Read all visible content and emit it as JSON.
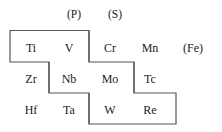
{
  "figure": {
    "kind": "periodic-table-fragment-diagram",
    "line_color": "#555555",
    "background_color": "#ffffff",
    "text_color": "#1a1a1a"
  },
  "group_headers": [
    {
      "label": "(P)",
      "x": 62,
      "y": 8,
      "width": 24
    },
    {
      "label": "(S)",
      "x": 103,
      "y": 8,
      "width": 24
    }
  ],
  "rows": [
    {
      "row_name": "row-1",
      "cells": [
        {
          "label": "Ti",
          "x": 14,
          "y": 41
        },
        {
          "label": "V",
          "x": 52,
          "y": 41
        },
        {
          "label": "Cr",
          "x": 93,
          "y": 41
        },
        {
          "label": "Mn",
          "x": 133,
          "y": 41
        },
        {
          "label": "(Fe)",
          "x": 176,
          "y": 41
        }
      ]
    },
    {
      "row_name": "row-2",
      "cells": [
        {
          "label": "Zr",
          "x": 14,
          "y": 72
        },
        {
          "label": "Nb",
          "x": 52,
          "y": 72
        },
        {
          "label": "Mo",
          "x": 93,
          "y": 72
        },
        {
          "label": "Tc",
          "x": 133,
          "y": 72
        }
      ]
    },
    {
      "row_name": "row-3",
      "cells": [
        {
          "label": "Hf",
          "x": 14,
          "y": 103
        },
        {
          "label": "Ta",
          "x": 52,
          "y": 103
        },
        {
          "label": "W",
          "x": 93,
          "y": 103
        },
        {
          "label": "Re",
          "x": 133,
          "y": 103
        }
      ]
    }
  ],
  "outline": {
    "description": "staircase boundary enclosing Ti V Cr Mn / Zr Nb Mo Tc / Hf Ta W Re region",
    "path": "M 10 30.5 L 89 30.5 L 89 62 L 134 62 L 134 93 L 176 93 L 176 124 L 89 124 L 89 93 L 49 93 L 49 62 L 10 62 L 10 30.5",
    "stroke_width": 1.2
  },
  "internal_dividers": [
    {
      "name": "divider-ti-v-right-of-v",
      "path": "M 89 30.5 L 89 62"
    },
    {
      "name": "divider-nb-mo",
      "path": "M 49 62 L 49 93"
    },
    {
      "name": "divider-ta-w",
      "path": "M 89 93 L 89 124"
    },
    {
      "name": "divider-mo-tc",
      "path": "M 134 62 L 134 93"
    }
  ]
}
